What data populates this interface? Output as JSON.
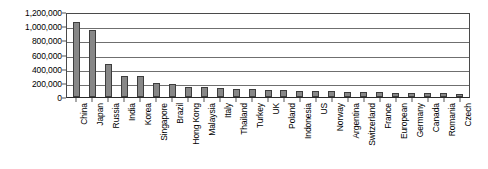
{
  "chart_data": {
    "type": "bar",
    "title": "",
    "xlabel": "",
    "ylabel": "",
    "ylim": [
      0,
      1200000
    ],
    "grid": true,
    "legend": null,
    "bar_color": "#878787",
    "bar_edge_color": "#3d3d3d",
    "ytick_labels": [
      "1,200,000",
      "1,000,000",
      "800,000",
      "600,000",
      "400,000",
      "200,000",
      "0"
    ],
    "ytick_values": [
      1200000,
      1000000,
      800000,
      600000,
      400000,
      200000,
      0
    ],
    "categories": [
      "China",
      "Japan",
      "Russia",
      "India",
      "Korea",
      "Singapore",
      "Brazil",
      "Hong Kong",
      "Malaysia",
      "Italy",
      "Thailand",
      "Turkey",
      "UK",
      "Poland",
      "Indonesia",
      "US",
      "Norway",
      "Argentina",
      "Switzerland",
      "France",
      "European",
      "Germany",
      "Canada",
      "Romania",
      "Czech"
    ],
    "values": [
      1060000,
      950000,
      460000,
      300000,
      300000,
      200000,
      190000,
      140000,
      135000,
      130000,
      120000,
      110000,
      100000,
      95000,
      90000,
      85000,
      80000,
      75000,
      72000,
      68000,
      62000,
      58000,
      55000,
      50000,
      48000
    ]
  }
}
